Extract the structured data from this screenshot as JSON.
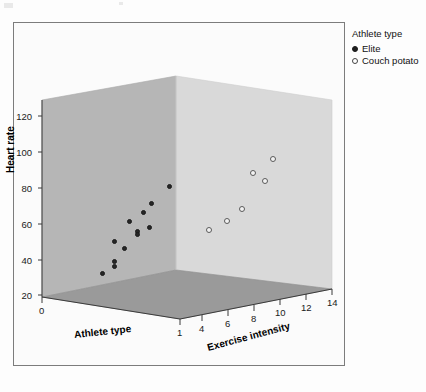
{
  "legend": {
    "title": "Athlete type",
    "entries": [
      {
        "label": "Elite",
        "marker": "filled-circle",
        "color": "#1f1f1f"
      },
      {
        "label": "Couch potato",
        "marker": "open-circle",
        "color": "#ffffff"
      }
    ]
  },
  "colors": {
    "left_wall": "#b8b8b8",
    "right_wall": "#d9d9d9",
    "floor": "#9a9a9a",
    "frame_border": "#7c7c7c",
    "elite_marker": "#262626",
    "couch_marker": "#f2f2f2",
    "page_background": "#fdfdfd"
  },
  "scan_artifact_text": "DISTRIBUTION OF ...",
  "chart_data": {
    "type": "scatter",
    "projection": "3d",
    "title": "",
    "xlabel": "Athlete type",
    "ylabel": "Heart rate",
    "zlabel": "Exercise intensity",
    "xticks": [
      "0",
      "1"
    ],
    "yticks": [
      "20",
      "40",
      "60",
      "80",
      "100",
      "120"
    ],
    "zticks": [
      "4",
      "6",
      "8",
      "10",
      "12",
      "14"
    ],
    "xlim": [
      0,
      1
    ],
    "ylim": [
      20,
      130
    ],
    "zlim": [
      3,
      14
    ],
    "grid": false,
    "legend_position": "outside top right",
    "series": [
      {
        "name": "Elite",
        "marker": "filled-circle",
        "points": [
          {
            "x": 0,
            "y": 33,
            "z": 4
          },
          {
            "x": 0,
            "y": 37,
            "z": 5
          },
          {
            "x": 0,
            "y": 40,
            "z": 5
          },
          {
            "x": 0,
            "y": 52,
            "z": 7
          },
          {
            "x": 0,
            "y": 56,
            "z": 6
          },
          {
            "x": 0,
            "y": 58,
            "z": 8
          },
          {
            "x": 0,
            "y": 60,
            "z": 8
          },
          {
            "x": 0,
            "y": 64,
            "z": 9
          },
          {
            "x": 0,
            "y": 65,
            "z": 7
          },
          {
            "x": 0,
            "y": 73,
            "z": 8
          },
          {
            "x": 0,
            "y": 79,
            "z": 9
          },
          {
            "x": 0,
            "y": 86,
            "z": 11
          }
        ]
      },
      {
        "name": "Couch potato",
        "marker": "open-circle",
        "points": [
          {
            "x": 1,
            "y": 62,
            "z": 5
          },
          {
            "x": 1,
            "y": 69,
            "z": 6
          },
          {
            "x": 1,
            "y": 80,
            "z": 8
          },
          {
            "x": 1,
            "y": 92,
            "z": 10
          },
          {
            "x": 1,
            "y": 96,
            "z": 9
          },
          {
            "x": 1,
            "y": 107,
            "z": 10
          }
        ]
      }
    ]
  },
  "pixel_layout": {
    "elite_points_px": [
      [
        101,
        272
      ],
      [
        113,
        260
      ],
      [
        113,
        265
      ],
      [
        123,
        247
      ],
      [
        113,
        240
      ],
      [
        136,
        230
      ],
      [
        136,
        233
      ],
      [
        148,
        226
      ],
      [
        128,
        220
      ],
      [
        142,
        211
      ],
      [
        150,
        202
      ],
      [
        168,
        185
      ]
    ],
    "couch_points_px": [
      [
        208,
        229
      ],
      [
        226,
        220
      ],
      [
        241,
        208
      ],
      [
        264,
        180
      ],
      [
        252,
        172
      ],
      [
        272,
        158
      ]
    ],
    "y_tick_px": [
      294,
      259,
      223,
      187,
      151,
      115
    ],
    "z_tick_px": [
      [
        222,
        298
      ],
      [
        243,
        293
      ],
      [
        264,
        288
      ],
      [
        285,
        283
      ],
      [
        306,
        278
      ],
      [
        327,
        273
      ]
    ],
    "x_tick_px": [
      [
        50,
        300
      ],
      [
        200,
        303
      ]
    ]
  }
}
